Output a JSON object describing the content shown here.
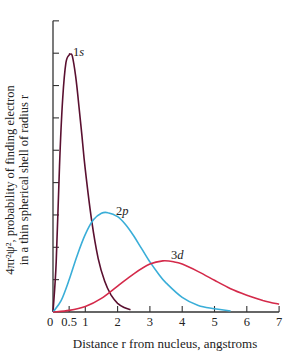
{
  "chart_data": {
    "type": "line",
    "title": "",
    "xlabel": "Distance r from nucleus, angstroms",
    "ylabel_line1": "4πr²ψ², probability of finding electron",
    "ylabel_line2": "in a thin spherical shell of radius r",
    "xlim": [
      0,
      7
    ],
    "ylim": [
      0,
      9
    ],
    "x_ticks": [
      0,
      0.5,
      1,
      2,
      3,
      4,
      5,
      6,
      7
    ],
    "x_tick_labels": [
      "0",
      "0.5",
      "1",
      "2",
      "3",
      "4",
      "5",
      "6",
      "7"
    ],
    "y_ticks": [
      0,
      1,
      2,
      3,
      4,
      5,
      6,
      7,
      8,
      9
    ],
    "y_tick_labels": [],
    "grid": false,
    "legend": "inline curve labels",
    "series": [
      {
        "name": "1s",
        "color": "#5a1030",
        "label_pos": [
          0.62,
          8.0
        ],
        "x": [
          0,
          0.1,
          0.2,
          0.3,
          0.4,
          0.5,
          0.53,
          0.6,
          0.7,
          0.8,
          0.9,
          1.0,
          1.2,
          1.4,
          1.6,
          1.8,
          2.0,
          2.2,
          2.4
        ],
        "values": [
          0,
          1.55,
          4.5,
          6.6,
          7.7,
          7.95,
          7.97,
          7.9,
          7.3,
          6.4,
          5.4,
          4.4,
          2.8,
          1.65,
          0.95,
          0.52,
          0.27,
          0.14,
          0.07
        ]
      },
      {
        "name": "2p",
        "color": "#3aaed8",
        "label_pos": [
          1.95,
          3.1
        ],
        "x": [
          0,
          0.25,
          0.5,
          0.75,
          1.0,
          1.25,
          1.5,
          1.7,
          2.0,
          2.25,
          2.5,
          2.75,
          3.0,
          3.25,
          3.5,
          4.0,
          4.5,
          5.0,
          5.5
        ],
        "values": [
          0,
          0.35,
          1.0,
          1.75,
          2.4,
          2.85,
          3.05,
          3.07,
          2.95,
          2.7,
          2.35,
          1.95,
          1.55,
          1.2,
          0.9,
          0.45,
          0.2,
          0.1,
          0.03
        ]
      },
      {
        "name": "3d",
        "color": "#d42a4a",
        "label_pos": [
          3.65,
          1.72
        ],
        "x": [
          0,
          0.5,
          1.0,
          1.5,
          2.0,
          2.5,
          3.0,
          3.4,
          3.75,
          4.0,
          4.5,
          5.0,
          5.5,
          6.0,
          6.5,
          7.0
        ],
        "values": [
          0,
          0.05,
          0.17,
          0.42,
          0.8,
          1.18,
          1.48,
          1.58,
          1.55,
          1.48,
          1.25,
          0.98,
          0.72,
          0.52,
          0.36,
          0.24
        ]
      }
    ]
  }
}
